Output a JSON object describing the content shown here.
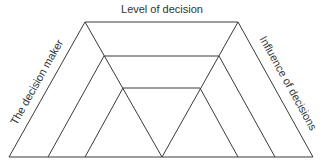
{
  "diagram": {
    "top_label": "Level of decision",
    "left_label": "The decision maker",
    "right_label": "Influence of decisions",
    "line_color": "#3a3a3a",
    "text_color": "#333333"
  }
}
